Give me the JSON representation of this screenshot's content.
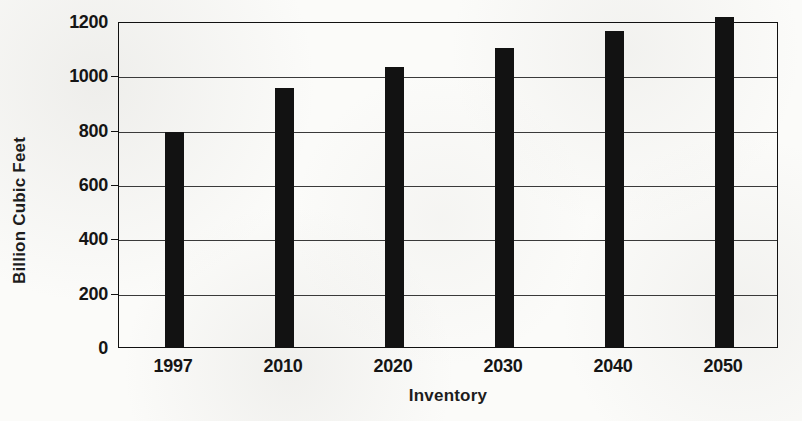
{
  "chart_data": {
    "type": "bar",
    "title": "",
    "xlabel": "Inventory",
    "ylabel": "Billion Cubic Feet",
    "categories": [
      "1997",
      "2010",
      "2020",
      "2030",
      "2040",
      "2050"
    ],
    "values": [
      790,
      955,
      1030,
      1100,
      1165,
      1215
    ],
    "ylim": [
      0,
      1200
    ],
    "yticks": [
      0,
      200,
      400,
      600,
      800,
      1000,
      1200
    ],
    "ytick_labels": [
      "0",
      "200",
      "400",
      "600",
      "800",
      "1000",
      "1200"
    ],
    "grid": true,
    "legend": false,
    "legend_position": "none",
    "bar_color": "#121212",
    "frame_color": "#111111",
    "gridline_color": "#3a3a3a",
    "background_color": "#fbfbf9"
  }
}
